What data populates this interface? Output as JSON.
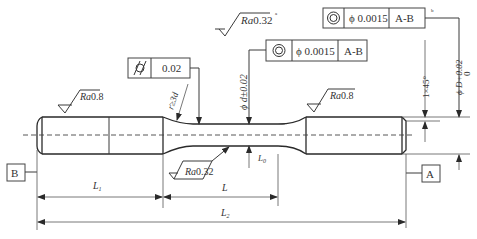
{
  "drawing": {
    "title": "Specimen shaft drawing",
    "roughness": {
      "overall": {
        "prefix": "Ra",
        "value": "0.32",
        "note": "a"
      },
      "left_grip": {
        "prefix": "Ra",
        "value": "0.8"
      },
      "right_grip": {
        "prefix": "Ra",
        "value": "0.8"
      },
      "gauge": {
        "prefix": "Ra",
        "value": "0.32"
      }
    },
    "tolerance_frames": {
      "cylindricity": {
        "symbol": "cylindricity",
        "value": "0.02"
      },
      "concentricity_gauge": {
        "symbol": "concentricity",
        "value": "ϕ 0.0015",
        "datum": "A-B"
      },
      "concentricity_grip": {
        "symbol": "concentricity",
        "value": "ϕ 0.0015",
        "datum": "A-B",
        "note": "b"
      }
    },
    "dimensions": {
      "fillet": "r≥3d",
      "gauge_dia": "ϕ d±0.02",
      "chamfer": "1×45°",
      "grip_dia_main": "ϕ D+0.02",
      "grip_dia_lower": "0",
      "L1": {
        "main": "L",
        "sub": "1"
      },
      "L": {
        "main": "L",
        "sub": ""
      },
      "L2": {
        "main": "L",
        "sub": "2"
      },
      "L0": {
        "main": "L",
        "sub": "0"
      }
    },
    "datums": {
      "left": "B",
      "right": "A"
    }
  }
}
